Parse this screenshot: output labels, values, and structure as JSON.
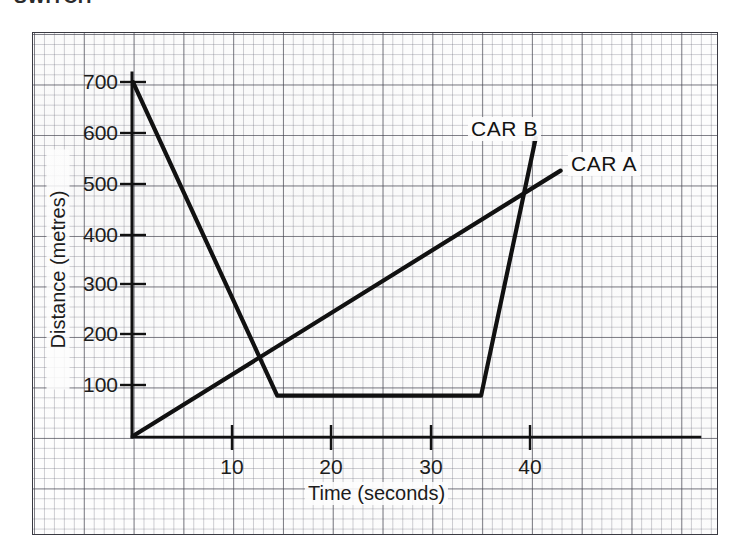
{
  "page": {
    "clipped_heading": "SWITCH"
  },
  "chart_data": {
    "type": "line",
    "title": "",
    "xlabel": "Time (seconds)",
    "ylabel": "Distance (metres)",
    "xlim": [
      0,
      46
    ],
    "ylim": [
      0,
      740
    ],
    "xticks": [
      10,
      20,
      30,
      40
    ],
    "yticks": [
      100,
      200,
      300,
      400,
      500,
      600,
      700
    ],
    "xtick_labels": [
      "10",
      "20",
      "30",
      "40"
    ],
    "ytick_labels": [
      "100",
      "200",
      "300",
      "400",
      "500",
      "600",
      "700"
    ],
    "grid": true,
    "grid_style": "graph-paper",
    "legend_position": "inline-annotation",
    "series": [
      {
        "name": "CAR A",
        "label": "CAR A",
        "color": "#111111",
        "x": [
          0,
          43
        ],
        "y": [
          0,
          525
        ]
      },
      {
        "name": "CAR B",
        "label": "CAR B",
        "color": "#111111",
        "x": [
          0,
          14.5,
          35,
          40.5
        ],
        "y": [
          700,
          80,
          80,
          590
        ]
      }
    ],
    "annotations": [
      {
        "text": "CAR B",
        "x": 33.5,
        "y": 630
      },
      {
        "text": "CAR A",
        "x": 43.5,
        "y": 560
      }
    ]
  }
}
